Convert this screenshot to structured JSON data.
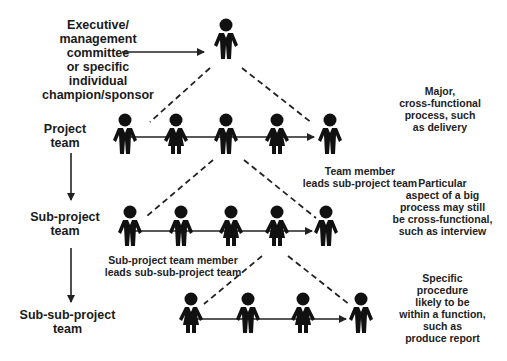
{
  "levels": [
    {
      "id": "executive",
      "label": "Executive/\nmanagement\ncommittee\nor specific\nindividual\nchampion/sponsor",
      "figures": [
        "male"
      ],
      "description": ""
    },
    {
      "id": "project",
      "label": "Project\nteam",
      "figures": [
        "male",
        "female",
        "male",
        "female",
        "male"
      ],
      "description": "Major,\ncross-functional\nprocess, such\nas delivery"
    },
    {
      "id": "sub-project",
      "label": "Sub-project\nteam",
      "figures": [
        "male",
        "male",
        "female",
        "female",
        "male"
      ],
      "description": "Particular\naspect of a big\nprocess may still\nbe cross-functional,\nsuch as interview"
    },
    {
      "id": "sub-sub-project",
      "label": "Sub-sub-project\nteam",
      "figures": [
        "female",
        "male",
        "female",
        "male"
      ],
      "description": "Specific\nprocedure\nlikely to be\nwithin a function,\nsuch as\nproduce report"
    }
  ],
  "notes": {
    "project_leader": "Team member\nleads sub-project team",
    "subproject_leader": "Sub-project team member\nleads sub-sub-project team"
  },
  "colors": {
    "figure": "#111111",
    "line": "#222222",
    "text": "#1a1a1a"
  }
}
